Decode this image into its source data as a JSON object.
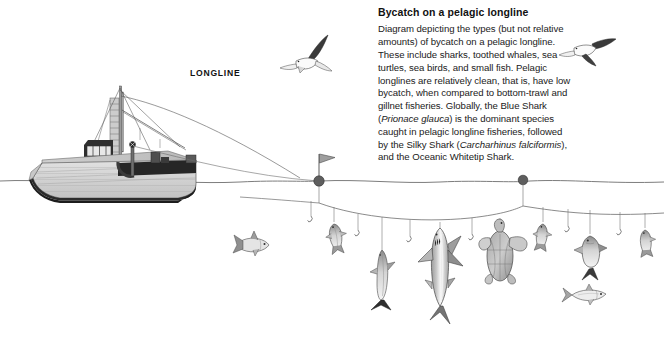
{
  "figure": {
    "title": "Bycatch on a pelagic longline",
    "caption_parts": {
      "p1": "Diagram depicting the types (but not relative amounts) of bycatch on a pelagic longline. These include sharks, toothed whales, sea turtles, sea birds, and small fish. Pelagic longlines are relatively clean, that is, have low bycatch, when compared to bottom-trawl and gillnet fisheries. Globally, the Blue Shark (",
      "sp1": "Prionace glauca",
      "p2": ") is the dominant species caught in pelagic longline fisheries, followed by the Silky Shark (",
      "sp2": "Carcharhinus falciformis",
      "p3": "), and the Oceanic Whitetip Shark."
    },
    "label_longline": "LONGLINE",
    "colors": {
      "ink": "#1a1a1a",
      "line": "#5a5a5a",
      "hull_light": "#d5d5d5",
      "hull_mid": "#b8b8b8",
      "hull_dark": "#3a3a3a",
      "deck_dark": "#2e2e2e",
      "buoy": "#6b6b6b",
      "flag": "#9a9a9a",
      "animal_fill": "#d8d8d8",
      "animal_shade": "#9a9a9a",
      "white": "#ffffff"
    }
  },
  "scene": {
    "waterline_label": "sea-surface",
    "vessel": {
      "name": "longline-fishing-vessel",
      "parts": [
        "hull",
        "wheelhouse",
        "mast",
        "boom",
        "rigging",
        "stern-deck",
        "line-hauler"
      ]
    },
    "birds": [
      {
        "id": "seabird-left",
        "x": 310,
        "y": 55
      },
      {
        "id": "seabird-right",
        "x": 585,
        "y": 45
      }
    ],
    "buoys": [
      {
        "id": "flag-buoy",
        "x": 319,
        "y": 180,
        "has_flag": true
      },
      {
        "id": "float-buoy",
        "x": 523,
        "y": 180,
        "has_flag": false
      }
    ],
    "mainline": {
      "id": "longline-mainline",
      "depth_sag": "catenary"
    },
    "gangions": [
      {
        "id": "gangion-1",
        "x": 311,
        "catch": "empty-hook"
      },
      {
        "id": "gangion-2",
        "x": 334,
        "catch": "small-fish"
      },
      {
        "id": "gangion-3",
        "x": 358,
        "catch": "empty-hook"
      },
      {
        "id": "gangion-4",
        "x": 382,
        "catch": "toothed-whale"
      },
      {
        "id": "gangion-5",
        "x": 410,
        "catch": "empty-hook"
      },
      {
        "id": "gangion-6",
        "x": 440,
        "catch": "shark"
      },
      {
        "id": "gangion-7",
        "x": 472,
        "catch": "empty-hook"
      },
      {
        "id": "gangion-8",
        "x": 500,
        "catch": "sea-turtle"
      },
      {
        "id": "gangion-9",
        "x": 543,
        "catch": "small-fish"
      },
      {
        "id": "gangion-10",
        "x": 568,
        "catch": "empty-hook"
      },
      {
        "id": "gangion-11",
        "x": 590,
        "catch": "fish"
      },
      {
        "id": "gangion-12",
        "x": 620,
        "catch": "empty-hook"
      },
      {
        "id": "gangion-13",
        "x": 645,
        "catch": "small-fish"
      }
    ],
    "free_swimming": [
      {
        "id": "free-fish-left",
        "x": 243,
        "y": 240
      },
      {
        "id": "free-fish-right",
        "x": 600,
        "y": 295
      }
    ]
  }
}
